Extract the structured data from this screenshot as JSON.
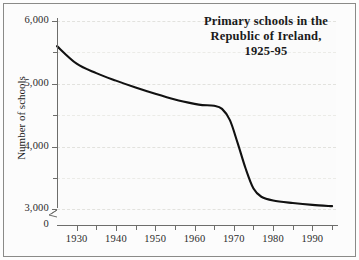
{
  "chart_data": {
    "type": "line",
    "title_lines": [
      "Primary schools in the",
      "Republic of Ireland,",
      "1925-95"
    ],
    "xlabel": "",
    "ylabel": "Number of schools",
    "xlim": [
      1925,
      1996
    ],
    "ylim": [
      2750,
      6000
    ],
    "y_axis_break": true,
    "y_break_label": "0",
    "grid": true,
    "legend": "none",
    "y_ticks_major": [
      3000,
      4000,
      5000,
      6000
    ],
    "y_ticks_minor": [
      3500,
      4500,
      5500
    ],
    "y_tick_labels": [
      "3,000",
      "4,000",
      "5,000",
      "6,000"
    ],
    "x_ticks_major": [
      1930,
      1940,
      1950,
      1960,
      1970,
      1980,
      1990
    ],
    "x_tick_labels": [
      "1930",
      "1940",
      "1950",
      "1960",
      "1970",
      "1980",
      "1990"
    ],
    "x_ticks_minor": [
      1935,
      1945,
      1955,
      1965,
      1975,
      1985,
      1995
    ],
    "series": [
      {
        "name": "Number of primary schools",
        "color": "#111111",
        "x": [
          1925,
          1930,
          1935,
          1940,
          1945,
          1950,
          1955,
          1960,
          1962,
          1965,
          1967,
          1969,
          1971,
          1973,
          1975,
          1977,
          1980,
          1985,
          1990,
          1995
        ],
        "values": [
          5600,
          5320,
          5170,
          5050,
          4940,
          4840,
          4750,
          4680,
          4660,
          4650,
          4600,
          4420,
          4050,
          3650,
          3330,
          3200,
          3140,
          3100,
          3070,
          3050
        ]
      }
    ]
  },
  "axis": {
    "y_title": "Number of schools",
    "zero_label": "0"
  }
}
